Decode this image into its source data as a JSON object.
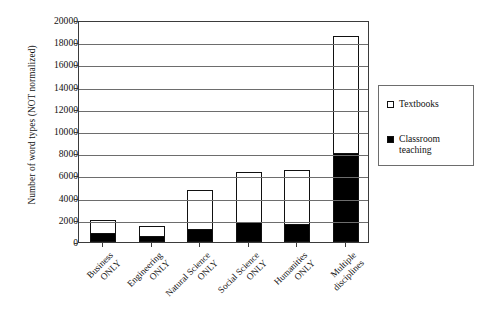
{
  "chart_data": {
    "type": "bar",
    "subtype": "stacked-vertical",
    "title": "",
    "xlabel": "",
    "ylabel": "Number of word types (NOT normalized)",
    "ylim": [
      0,
      20000
    ],
    "ytick_step": 2000,
    "ytick_labels": [
      "0",
      "2000",
      "4000",
      "6000",
      "8000",
      "10000",
      "12000",
      "14000",
      "16000",
      "18000",
      "20000"
    ],
    "ytick_values": [
      0,
      2000,
      4000,
      6000,
      8000,
      10000,
      12000,
      14000,
      16000,
      18000,
      20000
    ],
    "grid": true,
    "grid_axis": "y",
    "legend_position": "right",
    "categories": [
      "Business ONLY",
      "Engineering ONLY",
      "Natural Science ONLY",
      "Social Science ONLY",
      "Humanities ONLY",
      "Multiple disciplines"
    ],
    "category_lines": [
      [
        "Business",
        "ONLY"
      ],
      [
        "Engineering",
        "ONLY"
      ],
      [
        "Natural Science",
        "ONLY"
      ],
      [
        "Social Science",
        "ONLY"
      ],
      [
        "Humanities",
        "ONLY"
      ],
      [
        "Multiple",
        "disciplines"
      ]
    ],
    "series": [
      {
        "name": "Classroom teaching",
        "color": "#000000",
        "values": [
          800,
          550,
          1200,
          1800,
          1650,
          8050
        ]
      },
      {
        "name": "Textbooks",
        "color": "#ffffff",
        "values": [
          1200,
          900,
          3450,
          4550,
          4850,
          10550
        ]
      }
    ],
    "totals": [
      2000,
      1450,
      4650,
      6350,
      6500,
      18600
    ]
  },
  "legend": {
    "entries": [
      {
        "label": "Textbooks",
        "swatch": "hollow"
      },
      {
        "label": "Classroom teaching",
        "swatch": "filled"
      }
    ]
  },
  "colors": {
    "classroom_teaching": "#000000",
    "textbooks": "#ffffff",
    "axis": "#3b3b3b",
    "grid": "#6d6d6d",
    "background": "#ffffff"
  }
}
